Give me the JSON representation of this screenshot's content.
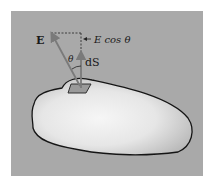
{
  "figure": {
    "labels": {
      "field_vector": "E",
      "projection": "E cos θ",
      "angle": "θ",
      "area_element": "dS"
    },
    "colors": {
      "panel": "#a9a9a9",
      "surface_light": "#f2f2f2",
      "surface_shadow": "#b8b8b8",
      "outline": "#151515",
      "vector": "#7a7a7a"
    }
  }
}
